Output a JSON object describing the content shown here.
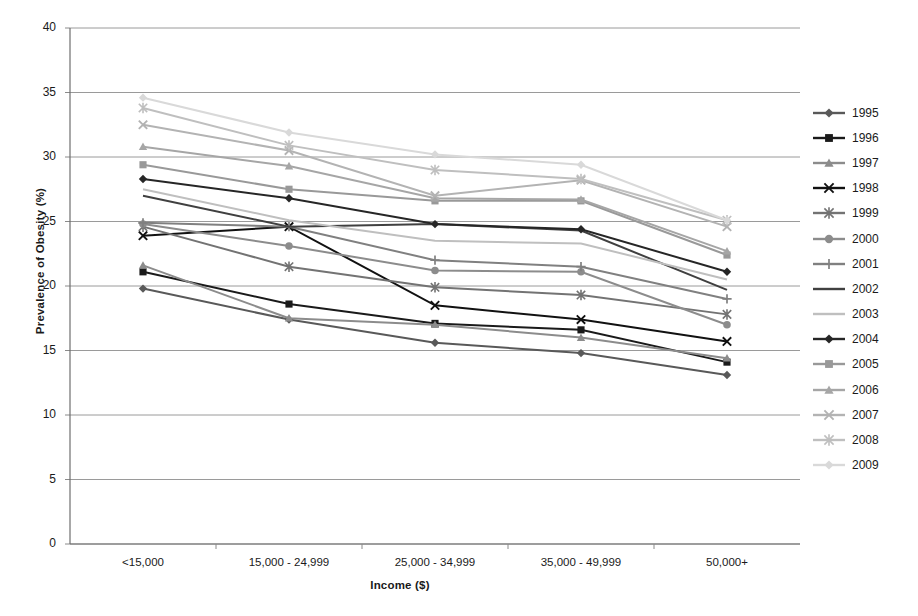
{
  "chart_data": {
    "type": "line",
    "title": "",
    "xlabel": "Income ($)",
    "ylabel": "Prevalence of Obesity (%)",
    "categories": [
      "<15,000",
      "15,000 - 24,999",
      "25,000 - 34,999",
      "35,000 - 49,999",
      "50,000+"
    ],
    "ylim": [
      0,
      40
    ],
    "ytick_step": 5,
    "yticks": [
      0,
      5,
      10,
      15,
      20,
      25,
      30,
      35,
      40
    ],
    "grid": true,
    "legend_position": "right",
    "series": [
      {
        "name": "1995",
        "marker": "diamond",
        "color": "#595959",
        "values": [
          19.8,
          17.4,
          15.6,
          14.8,
          13.1
        ]
      },
      {
        "name": "1996",
        "marker": "square",
        "color": "#1a1a1a",
        "values": [
          21.1,
          18.6,
          17.1,
          16.6,
          14.1
        ]
      },
      {
        "name": "1997",
        "marker": "triangle",
        "color": "#8c8c8c",
        "values": [
          21.6,
          17.5,
          17.0,
          16.0,
          14.4
        ]
      },
      {
        "name": "1998",
        "marker": "cross",
        "color": "#111111",
        "values": [
          23.9,
          24.6,
          18.5,
          17.4,
          15.7
        ]
      },
      {
        "name": "1999",
        "marker": "star",
        "color": "#737373",
        "values": [
          24.6,
          21.5,
          19.9,
          19.3,
          17.8
        ]
      },
      {
        "name": "2000",
        "marker": "circle",
        "color": "#8c8c8c",
        "values": [
          24.8,
          23.1,
          21.2,
          21.1,
          17.0
        ]
      },
      {
        "name": "2001",
        "marker": "plus",
        "color": "#808080",
        "values": [
          24.9,
          24.6,
          22.0,
          21.5,
          19.0
        ]
      },
      {
        "name": "2002",
        "marker": "line",
        "color": "#404040",
        "values": [
          27.0,
          24.6,
          24.8,
          24.3,
          19.7
        ]
      },
      {
        "name": "2003",
        "marker": "line",
        "color": "#bfbfbf",
        "values": [
          27.5,
          25.1,
          23.5,
          23.3,
          20.5
        ]
      },
      {
        "name": "2004",
        "marker": "diamond",
        "color": "#262626",
        "values": [
          28.3,
          26.8,
          24.8,
          24.4,
          21.1
        ]
      },
      {
        "name": "2005",
        "marker": "square",
        "color": "#999999",
        "values": [
          29.4,
          27.5,
          26.6,
          26.6,
          22.4
        ]
      },
      {
        "name": "2006",
        "marker": "triangle",
        "color": "#a6a6a6",
        "values": [
          30.8,
          29.3,
          26.8,
          26.7,
          22.7
        ]
      },
      {
        "name": "2007",
        "marker": "cross",
        "color": "#b3b3b3",
        "values": [
          32.5,
          30.5,
          27.0,
          28.2,
          24.6
        ]
      },
      {
        "name": "2008",
        "marker": "star",
        "color": "#bfbfbf",
        "values": [
          33.8,
          30.9,
          29.0,
          28.3,
          25.1
        ]
      },
      {
        "name": "2009",
        "marker": "diamond",
        "color": "#d9d9d9",
        "values": [
          34.6,
          31.9,
          30.2,
          29.4,
          25.1
        ]
      }
    ]
  },
  "axis": {
    "ylabel_text": "Prevalence of Obesity (%)",
    "xlabel_text": "Income ($)"
  }
}
